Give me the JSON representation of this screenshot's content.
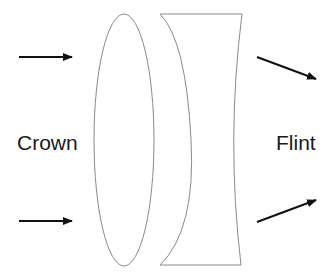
{
  "diagram": {
    "labels": {
      "left": "Crown",
      "right": "Flint"
    },
    "colors": {
      "lens_stroke": "#8a8a8a",
      "arrow": "#111111",
      "text": "#1a1a1a",
      "background": "#ffffff"
    },
    "elements": [
      {
        "id": "crown-lens",
        "shape": "biconvex-ellipse"
      },
      {
        "id": "flint-lens",
        "shape": "plano-concave"
      },
      {
        "id": "incoming-ray-top",
        "direction": "right"
      },
      {
        "id": "incoming-ray-bottom",
        "direction": "right"
      },
      {
        "id": "outgoing-ray-top",
        "direction": "down-right"
      },
      {
        "id": "outgoing-ray-bottom",
        "direction": "up-right"
      }
    ]
  }
}
